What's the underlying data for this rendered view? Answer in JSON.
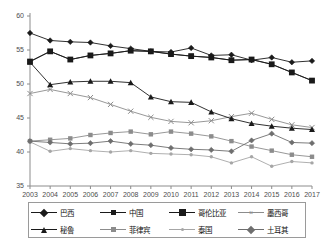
{
  "chart_data": {
    "type": "line",
    "title": "",
    "xlabel": "",
    "ylabel": "",
    "x": [
      2003,
      2004,
      2005,
      2006,
      2007,
      2008,
      2009,
      2010,
      2011,
      2012,
      2013,
      2014,
      2015,
      2016,
      2017
    ],
    "xtick_labels": [
      "2003",
      "2004",
      "2005",
      "2006",
      "2007",
      "2008",
      "2009",
      "2010",
      "2011",
      "2012",
      "2013",
      "2014",
      "2015",
      "2016",
      "2017"
    ],
    "ytick_labels": [
      "35",
      "40",
      "45",
      "50",
      "55",
      "60"
    ],
    "ylim": [
      35,
      60
    ],
    "xlim": [
      2003,
      2017
    ],
    "grid": false,
    "legend_position": "bottom",
    "series": [
      {
        "name": "巴西",
        "marker": "diamond",
        "color": "#1a1a1a",
        "values": [
          57.5,
          56.4,
          56.2,
          56.1,
          55.6,
          55.2,
          54.8,
          54.7,
          55.3,
          54.2,
          54.3,
          53.5,
          53.9,
          53.2,
          53.4
        ]
      },
      {
        "name": "中国",
        "marker": "square",
        "color": "#1a1a1a",
        "values": [
          53.3,
          54.8,
          53.6,
          54.2,
          54.5,
          54.9,
          54.8,
          54.4,
          54.1,
          53.9,
          53.5,
          53.6,
          52.9,
          51.7,
          50.5
        ]
      },
      {
        "name": "哥伦比亚",
        "marker": "square-large",
        "color": "#1a1a1a",
        "values": [
          53.3,
          54.8,
          53.6,
          54.2,
          54.5,
          54.9,
          54.8,
          54.4,
          54.1,
          53.9,
          53.5,
          53.6,
          52.9,
          51.7,
          50.5
        ]
      },
      {
        "name": "墨西哥",
        "marker": "cross",
        "color": "#8c8c8c",
        "values": [
          48.6,
          49.2,
          48.6,
          48.0,
          47.0,
          46.0,
          45.1,
          44.5,
          44.3,
          44.6,
          45.2,
          45.7,
          44.8,
          44.0,
          43.6
        ]
      },
      {
        "name": "秘鲁",
        "marker": "triangle",
        "color": "#1a1a1a",
        "values": [
          53.2,
          49.9,
          50.3,
          50.4,
          50.4,
          50.2,
          48.1,
          47.4,
          47.3,
          45.9,
          44.9,
          44.2,
          43.8,
          43.5,
          43.3
        ]
      },
      {
        "name": "菲律宾",
        "marker": "square-gray",
        "color": "#8c8c8c",
        "values": [
          41.6,
          41.8,
          42.0,
          42.5,
          42.8,
          43.0,
          42.6,
          43.0,
          42.7,
          42.3,
          41.6,
          40.8,
          40.2,
          39.6,
          39.3
        ]
      },
      {
        "name": "泰国",
        "marker": "dot",
        "color": "#a6a6a6",
        "values": [
          41.5,
          40.1,
          40.5,
          40.2,
          40.0,
          40.2,
          39.8,
          39.7,
          39.6,
          39.3,
          38.4,
          39.3,
          37.9,
          38.6,
          38.4
        ]
      },
      {
        "name": "土耳其",
        "marker": "diamond-gray",
        "color": "#6e6e6e",
        "values": [
          41.6,
          41.4,
          41.2,
          41.3,
          41.6,
          41.2,
          41.0,
          40.6,
          40.4,
          40.3,
          40.1,
          41.7,
          42.7,
          41.4,
          41.3
        ]
      }
    ]
  }
}
